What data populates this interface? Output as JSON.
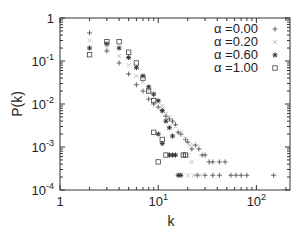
{
  "chart_data": {
    "type": "scatter",
    "title": "",
    "xlabel": "k",
    "ylabel": "P(k)",
    "xscale": "log",
    "yscale": "log",
    "xlim": [
      1,
      220
    ],
    "ylim": [
      0.0001,
      1
    ],
    "grid": false,
    "legend_position": "upper right",
    "x_ticks": [
      {
        "value": 1,
        "label": "1"
      },
      {
        "value": 10,
        "label": "10",
        "exp": "1"
      },
      {
        "value": 100,
        "label": "10",
        "exp": "2"
      }
    ],
    "y_ticks": [
      {
        "value": 1,
        "label": "1"
      },
      {
        "value": 0.1,
        "label": "10",
        "exp": "-1"
      },
      {
        "value": 0.01,
        "label": "10",
        "exp": "-2"
      },
      {
        "value": 0.001,
        "label": "10",
        "exp": "-3"
      },
      {
        "value": 0.0001,
        "label": "10",
        "exp": "-4"
      }
    ],
    "series": [
      {
        "name": "α =0.00",
        "marker": "plus",
        "color": "#555555",
        "points": [
          [
            2,
            0.45
          ],
          [
            3,
            0.17
          ],
          [
            4,
            0.09
          ],
          [
            5,
            0.05
          ],
          [
            6,
            0.028
          ],
          [
            7,
            0.02
          ],
          [
            8,
            0.013
          ],
          [
            9,
            0.01
          ],
          [
            10,
            0.0085
          ],
          [
            11,
            0.007
          ],
          [
            12,
            0.0052
          ],
          [
            13,
            0.0045
          ],
          [
            14,
            0.004
          ],
          [
            15,
            0.0033
          ],
          [
            16,
            0.0022
          ],
          [
            17,
            0.002
          ],
          [
            19,
            0.0015
          ],
          [
            20,
            0.0013
          ],
          [
            22,
            0.0009
          ],
          [
            24,
            0.0011
          ],
          [
            26,
            0.0009
          ],
          [
            28,
            0.00065
          ],
          [
            30,
            0.00065
          ],
          [
            33,
            0.00045
          ],
          [
            36,
            0.00045
          ],
          [
            42,
            0.00045
          ],
          [
            48,
            0.00045
          ],
          [
            25,
            0.00022
          ],
          [
            30,
            0.00022
          ],
          [
            36,
            0.00022
          ],
          [
            42,
            0.00022
          ],
          [
            55,
            0.00022
          ],
          [
            62,
            0.00022
          ],
          [
            70,
            0.00022
          ],
          [
            80,
            0.00022
          ],
          [
            150,
            0.00022
          ]
        ]
      },
      {
        "name": "α =0.20",
        "marker": "cross",
        "color": "#bbbbbb",
        "points": [
          [
            2,
            0.3
          ],
          [
            3,
            0.2
          ],
          [
            4,
            0.13
          ],
          [
            5,
            0.08
          ],
          [
            6,
            0.045
          ],
          [
            7,
            0.032
          ],
          [
            8,
            0.02
          ],
          [
            9,
            0.015
          ],
          [
            10,
            0.011
          ],
          [
            11,
            0.009
          ],
          [
            12,
            0.006
          ],
          [
            13,
            0.005
          ],
          [
            14,
            0.0035
          ],
          [
            15,
            0.003
          ],
          [
            17,
            0.0022
          ],
          [
            19,
            0.0016
          ],
          [
            21,
            0.0011
          ],
          [
            23,
            0.0011
          ],
          [
            18,
            0.00065
          ],
          [
            20,
            0.00065
          ],
          [
            22,
            0.00045
          ],
          [
            20,
            0.00022
          ],
          [
            23,
            0.00022
          ],
          [
            27,
            0.00022
          ]
        ]
      },
      {
        "name": "α =0.60",
        "marker": "star",
        "color": "#333333",
        "points": [
          [
            2,
            0.2
          ],
          [
            3,
            0.25
          ],
          [
            4,
            0.2
          ],
          [
            5,
            0.12
          ],
          [
            6,
            0.07
          ],
          [
            7,
            0.045
          ],
          [
            8,
            0.025
          ],
          [
            9,
            0.017
          ],
          [
            10,
            0.012
          ],
          [
            11,
            0.007
          ],
          [
            12,
            0.004
          ],
          [
            13,
            0.0028
          ],
          [
            14,
            0.0018
          ],
          [
            10,
            0.002
          ],
          [
            11,
            0.0012
          ],
          [
            13,
            0.00065
          ],
          [
            14,
            0.00065
          ],
          [
            15,
            0.00065
          ],
          [
            16,
            0.00022
          ],
          [
            17,
            0.00022
          ]
        ]
      },
      {
        "name": "α =1.00",
        "marker": "square",
        "color": "#444444",
        "points": [
          [
            2,
            0.14
          ],
          [
            3,
            0.28
          ],
          [
            4,
            0.28
          ],
          [
            5,
            0.16
          ],
          [
            6,
            0.09
          ],
          [
            7,
            0.04
          ],
          [
            8,
            0.02
          ],
          [
            9,
            0.012
          ],
          [
            9,
            0.0022
          ],
          [
            11,
            0.0015
          ],
          [
            12,
            0.00065
          ],
          [
            10,
            0.00045
          ],
          [
            18,
            0.00065
          ],
          [
            19,
            0.00065
          ]
        ]
      }
    ]
  },
  "legend": {
    "items": [
      {
        "label": "α =0.00",
        "marker": "plus"
      },
      {
        "label": "α =0.20",
        "marker": "cross"
      },
      {
        "label": "α =0.60",
        "marker": "star"
      },
      {
        "label": "α =1.00",
        "marker": "square"
      }
    ]
  },
  "axes": {
    "xlabel": "k",
    "ylabel": "P(k)"
  }
}
